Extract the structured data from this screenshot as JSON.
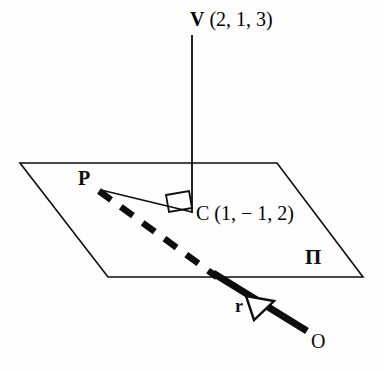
{
  "figure": {
    "kind": "3d-geometry-diagram",
    "background_color": "#fefefe",
    "ink_color": "#0d0d0d"
  },
  "labels": {
    "vertex_v": "V",
    "vertex_v_coords": "(2, 1, 3)",
    "vertex_c": "C",
    "vertex_c_coords": "(1, − 1, 2)",
    "vertex_p": "P",
    "plane": "Π",
    "line_r": "r",
    "point_o": "O"
  },
  "geometry": {
    "plane_corners": [
      [
        20,
        163
      ],
      [
        277,
        163
      ],
      [
        363,
        277
      ],
      [
        108,
        277
      ]
    ],
    "point_v": [
      192,
      35
    ],
    "point_c": [
      192,
      213
    ],
    "point_p": [
      97,
      190
    ],
    "point_o": [
      306,
      330
    ],
    "line_r_entry": [
      215,
      275
    ],
    "dashed_start": [
      100,
      192
    ],
    "dashed_end": [
      216,
      276
    ],
    "right_angle_marker": [
      173,
      193
    ],
    "arrow_head_center": [
      259,
      306
    ]
  },
  "styles": {
    "plane_stroke_width": 1.6,
    "vertical_stroke_width": 1.8,
    "thin_segment_stroke_width": 1.7,
    "dashed_stroke_width": 6.5,
    "thick_line_stroke_width": 7.0
  }
}
